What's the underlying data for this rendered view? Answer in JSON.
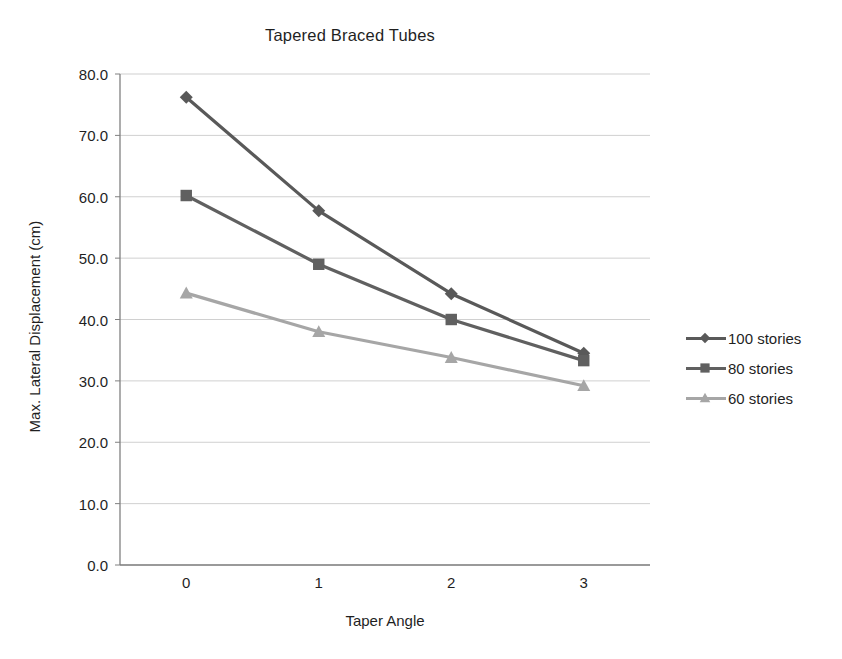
{
  "chart_data": {
    "type": "line",
    "title": "Tapered Braced Tubes",
    "xlabel": "Taper Angle",
    "ylabel": "Max. Lateral Displacement (cm)",
    "categories": [
      "0",
      "1",
      "2",
      "3"
    ],
    "x": [
      0,
      1,
      2,
      3
    ],
    "ylim": [
      0.0,
      80.0
    ],
    "ytick_labels": [
      "0.0",
      "10.0",
      "20.0",
      "30.0",
      "40.0",
      "50.0",
      "60.0",
      "70.0",
      "80.0"
    ],
    "ytick_values": [
      0.0,
      10.0,
      20.0,
      30.0,
      40.0,
      50.0,
      60.0,
      70.0,
      80.0
    ],
    "grid": true,
    "grid_axis": "y",
    "legend_position": "right",
    "series": [
      {
        "name": "100 stories",
        "marker": "diamond",
        "color": "#595959",
        "values": [
          76.2,
          57.7,
          44.2,
          34.5
        ]
      },
      {
        "name": "80 stories",
        "marker": "square",
        "color": "#606060",
        "values": [
          60.2,
          49.0,
          40.0,
          33.3
        ]
      },
      {
        "name": "60 stories",
        "marker": "triangle",
        "color": "#a6a6a6",
        "values": [
          44.3,
          38.0,
          33.8,
          29.2
        ]
      }
    ]
  },
  "legend": {
    "items": [
      {
        "label": "100 stories"
      },
      {
        "label": "80 stories"
      },
      {
        "label": "60 stories"
      }
    ]
  },
  "axis_colors": {
    "axis_line": "#808080",
    "grid_line": "#d0d0d0"
  }
}
